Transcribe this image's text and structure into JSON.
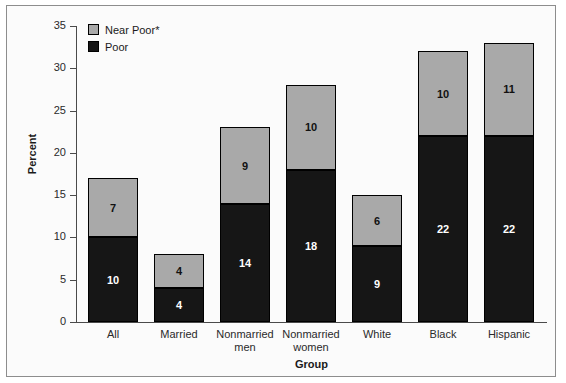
{
  "chart_data": {
    "type": "bar",
    "subtype": "stacked-bar",
    "title": "",
    "xlabel": "Group",
    "ylabel": "Percent",
    "ylim": [
      0,
      35
    ],
    "yticks": [
      0,
      5,
      10,
      15,
      20,
      25,
      30,
      35
    ],
    "grid": false,
    "legend_position": "top-left-inside",
    "categories": [
      "All",
      "Married",
      "Nonmarried men",
      "Nonmarried women",
      "White",
      "Black",
      "Hispanic"
    ],
    "category_labels_wrapped": [
      [
        "All"
      ],
      [
        "Married"
      ],
      [
        "Nonmarried",
        "men"
      ],
      [
        "Nonmarried",
        "women"
      ],
      [
        "White"
      ],
      [
        "Black"
      ],
      [
        "Hispanic"
      ]
    ],
    "series": [
      {
        "name": "Poor",
        "color": "#161616",
        "label_color": "#ffffff",
        "values": [
          10,
          4,
          14,
          18,
          9,
          22,
          22
        ]
      },
      {
        "name": "Near Poor*",
        "color": "#a9a9a9",
        "label_color": "#111111",
        "values": [
          7,
          4,
          9,
          10,
          6,
          10,
          11
        ]
      }
    ],
    "totals": [
      17,
      8,
      23,
      28,
      15,
      32,
      33
    ]
  },
  "legend": {
    "items": [
      {
        "label": "Near Poor*",
        "swatch": "near-poor-swatch"
      },
      {
        "label": "Poor",
        "swatch": "poor-swatch"
      }
    ]
  },
  "axes": {
    "y_title": "Percent",
    "x_title": "Group",
    "y_tick_labels": [
      "35",
      "30",
      "25",
      "20",
      "15",
      "10",
      "5",
      "0"
    ]
  },
  "colors": {
    "near_poor": "#a9a9a9",
    "poor": "#161616",
    "frame": "#8d8d8d",
    "background": "#fbfbfb",
    "axis": "#4a4a4a"
  }
}
